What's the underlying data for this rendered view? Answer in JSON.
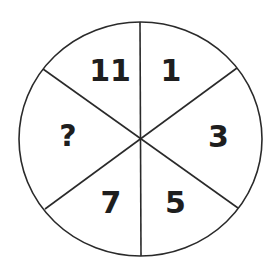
{
  "diagram": {
    "type": "number-wheel-puzzle",
    "shape": "circle",
    "segments": 6,
    "sectors": [
      {
        "position": "top-left",
        "label": "11"
      },
      {
        "position": "top-right",
        "label": "1"
      },
      {
        "position": "right",
        "label": "3"
      },
      {
        "position": "bottom-right",
        "label": "5"
      },
      {
        "position": "bottom-left",
        "label": "7"
      },
      {
        "position": "left",
        "label": "?"
      }
    ],
    "colors": {
      "line": "#2a2a2a",
      "text": "#1e1e1e",
      "background": "#ffffff"
    }
  }
}
